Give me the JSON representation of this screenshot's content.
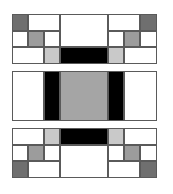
{
  "colors": {
    "white": "#ffffff",
    "dark_gray": "#6f6f6f",
    "mid_gray": "#9c9c9c",
    "light_gray": "#c9c9c9",
    "center_gray": "#a5a5a5",
    "black": "#000000",
    "border": "#5a5a5a"
  },
  "blocks": [
    {
      "name": "top-block",
      "top": 14,
      "cells": [
        {
          "x": 0,
          "y": 0,
          "w": 16,
          "h": 17,
          "fill": "dark_gray"
        },
        {
          "x": 16,
          "y": 0,
          "w": 32,
          "h": 17,
          "fill": "white"
        },
        {
          "x": 48,
          "y": 0,
          "w": 48,
          "h": 33,
          "fill": "white"
        },
        {
          "x": 96,
          "y": 0,
          "w": 32,
          "h": 17,
          "fill": "white"
        },
        {
          "x": 128,
          "y": 0,
          "w": 17,
          "h": 17,
          "fill": "dark_gray"
        },
        {
          "x": 0,
          "y": 17,
          "w": 16,
          "h": 16,
          "fill": "white"
        },
        {
          "x": 16,
          "y": 17,
          "w": 16,
          "h": 16,
          "fill": "mid_gray"
        },
        {
          "x": 32,
          "y": 17,
          "w": 16,
          "h": 16,
          "fill": "white"
        },
        {
          "x": 96,
          "y": 17,
          "w": 16,
          "h": 16,
          "fill": "white"
        },
        {
          "x": 112,
          "y": 17,
          "w": 16,
          "h": 16,
          "fill": "mid_gray"
        },
        {
          "x": 128,
          "y": 17,
          "w": 17,
          "h": 16,
          "fill": "white"
        },
        {
          "x": 0,
          "y": 33,
          "w": 32,
          "h": 17,
          "fill": "white"
        },
        {
          "x": 32,
          "y": 33,
          "w": 16,
          "h": 17,
          "fill": "light_gray"
        },
        {
          "x": 48,
          "y": 33,
          "w": 48,
          "h": 17,
          "fill": "black"
        },
        {
          "x": 96,
          "y": 33,
          "w": 16,
          "h": 17,
          "fill": "light_gray"
        },
        {
          "x": 112,
          "y": 33,
          "w": 33,
          "h": 17,
          "fill": "white"
        }
      ]
    },
    {
      "name": "middle-block",
      "top": 71,
      "cells": [
        {
          "x": 0,
          "y": 0,
          "w": 32,
          "h": 50,
          "fill": "white"
        },
        {
          "x": 32,
          "y": 0,
          "w": 16,
          "h": 50,
          "fill": "black"
        },
        {
          "x": 48,
          "y": 0,
          "w": 48,
          "h": 50,
          "fill": "center_gray"
        },
        {
          "x": 96,
          "y": 0,
          "w": 16,
          "h": 50,
          "fill": "black"
        },
        {
          "x": 112,
          "y": 0,
          "w": 33,
          "h": 50,
          "fill": "white"
        }
      ]
    },
    {
      "name": "bottom-block",
      "top": 128,
      "cells": [
        {
          "x": 0,
          "y": 0,
          "w": 32,
          "h": 17,
          "fill": "white"
        },
        {
          "x": 32,
          "y": 0,
          "w": 16,
          "h": 17,
          "fill": "light_gray"
        },
        {
          "x": 48,
          "y": 0,
          "w": 48,
          "h": 17,
          "fill": "black"
        },
        {
          "x": 96,
          "y": 0,
          "w": 16,
          "h": 17,
          "fill": "light_gray"
        },
        {
          "x": 112,
          "y": 0,
          "w": 33,
          "h": 17,
          "fill": "white"
        },
        {
          "x": 0,
          "y": 17,
          "w": 16,
          "h": 16,
          "fill": "white"
        },
        {
          "x": 16,
          "y": 17,
          "w": 16,
          "h": 16,
          "fill": "mid_gray"
        },
        {
          "x": 32,
          "y": 17,
          "w": 16,
          "h": 16,
          "fill": "white"
        },
        {
          "x": 48,
          "y": 17,
          "w": 48,
          "h": 33,
          "fill": "white"
        },
        {
          "x": 96,
          "y": 17,
          "w": 16,
          "h": 16,
          "fill": "white"
        },
        {
          "x": 112,
          "y": 17,
          "w": 16,
          "h": 16,
          "fill": "mid_gray"
        },
        {
          "x": 128,
          "y": 17,
          "w": 17,
          "h": 16,
          "fill": "white"
        },
        {
          "x": 0,
          "y": 33,
          "w": 16,
          "h": 17,
          "fill": "dark_gray"
        },
        {
          "x": 16,
          "y": 33,
          "w": 32,
          "h": 17,
          "fill": "white"
        },
        {
          "x": 96,
          "y": 33,
          "w": 32,
          "h": 17,
          "fill": "white"
        },
        {
          "x": 128,
          "y": 33,
          "w": 17,
          "h": 17,
          "fill": "dark_gray"
        }
      ]
    }
  ]
}
